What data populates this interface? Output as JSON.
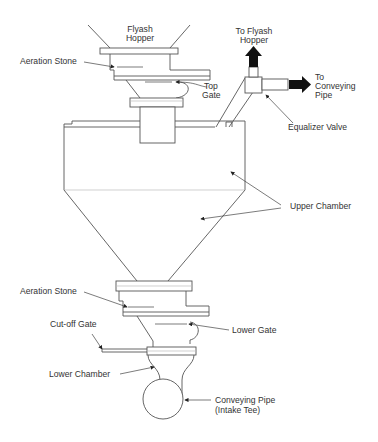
{
  "diagram": {
    "labels": {
      "flyash_hopper": [
        "Flyash",
        "Hopper"
      ],
      "aeration_stone_top": "Aeration Stone",
      "top_gate": [
        "Top",
        "Gate"
      ],
      "to_flyash_hopper": [
        "To Flyash",
        "Hopper"
      ],
      "to_conveying_pipe": [
        "To",
        "Conveying",
        "Pipe"
      ],
      "equalizer_valve": "Equalizer Valve",
      "upper_chamber": "Upper Chamber",
      "aeration_stone_bottom": "Aeration Stone",
      "lower_gate": "Lower Gate",
      "cutoff_gate": "Cut-off Gate",
      "lower_chamber": "Lower Chamber",
      "conveying_pipe": [
        "Conveying Pipe",
        "(Intake Tee)"
      ]
    },
    "colors": {
      "line": "#555555",
      "text": "#333333",
      "arrow_fill": "#111111",
      "background": "#ffffff"
    }
  }
}
